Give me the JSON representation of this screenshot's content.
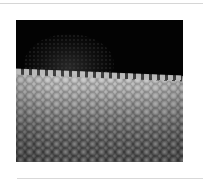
{
  "figure": {
    "colors": {
      "background": "#030303",
      "surface_highlight": "#cfcfcf",
      "surface_shadow": "#3a3a3a",
      "page": "#ffffff",
      "rule": "#d6d6d6"
    }
  }
}
